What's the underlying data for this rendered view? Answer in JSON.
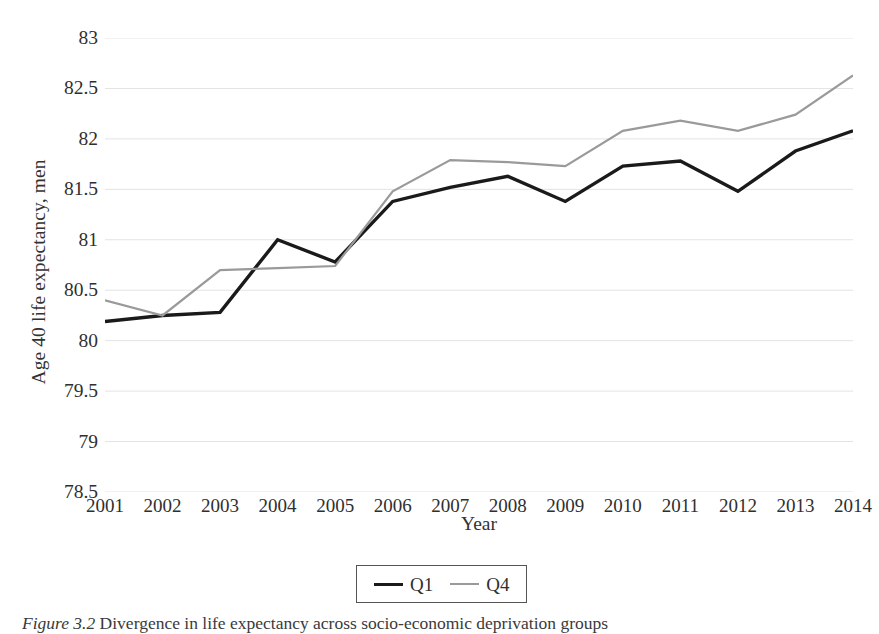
{
  "figure": {
    "caption_label": "Figure 3.2",
    "caption_text": "Divergence in life expectancy across socio-economic deprivation groups"
  },
  "chart_data": {
    "type": "line",
    "title": "",
    "xlabel": "Year",
    "ylabel": "Age 40 life expectancy, men",
    "categories": [
      2001,
      2002,
      2003,
      2004,
      2005,
      2006,
      2007,
      2008,
      2009,
      2010,
      2011,
      2012,
      2013,
      2014
    ],
    "x": [
      2001,
      2002,
      2003,
      2004,
      2005,
      2006,
      2007,
      2008,
      2009,
      2010,
      2011,
      2012,
      2013,
      2014
    ],
    "xlim": [
      2001,
      2014
    ],
    "ylim": [
      78.5,
      83
    ],
    "yticks": [
      78.5,
      79,
      79.5,
      80,
      80.5,
      81,
      81.5,
      82,
      82.5,
      83
    ],
    "ytick_labels": [
      "78.5",
      "79",
      "79.5",
      "80",
      "80.5",
      "81",
      "81.5",
      "82",
      "82.5",
      "83"
    ],
    "xtick_labels": [
      "2001",
      "2002",
      "2003",
      "2004",
      "2005",
      "2006",
      "2007",
      "2008",
      "2009",
      "2010",
      "2011",
      "2012",
      "2013",
      "2014"
    ],
    "grid": true,
    "grid_axis": "y",
    "grid_color": "#e3e3e3",
    "legend_position": "bottom-center",
    "series": [
      {
        "name": "Q1",
        "color": "#1a1a1a",
        "line_width": 3.4,
        "values": [
          80.19,
          80.25,
          80.28,
          81.0,
          80.78,
          81.38,
          81.52,
          81.63,
          81.38,
          81.73,
          81.78,
          81.48,
          81.88,
          82.08
        ]
      },
      {
        "name": "Q4",
        "color": "#9a9a9a",
        "line_width": 2.2,
        "values": [
          80.4,
          80.25,
          80.7,
          80.72,
          80.74,
          81.48,
          81.79,
          81.77,
          81.73,
          82.08,
          82.18,
          82.08,
          82.24,
          82.63
        ]
      }
    ]
  }
}
